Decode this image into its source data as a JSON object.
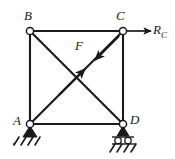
{
  "figure": {
    "type": "statics-truss-free-body-diagram",
    "stroke_color": "#1a1a1a",
    "fill_color": "#ffffff",
    "background": "#ffffff"
  },
  "labels": {
    "node_b": "B",
    "node_c": "C",
    "node_a": "A",
    "node_d": "D",
    "force_f": "F",
    "reaction_r": "R",
    "reaction_r_sub": "C"
  },
  "nodes": [
    {
      "id": "B",
      "label": "B",
      "x": 30,
      "y": 31
    },
    {
      "id": "C",
      "label": "C",
      "x": 123,
      "y": 31
    },
    {
      "id": "A",
      "label": "A",
      "x": 30,
      "y": 124
    },
    {
      "id": "D",
      "label": "D",
      "x": 123,
      "y": 124
    }
  ],
  "members": [
    {
      "from": "B",
      "to": "C",
      "kind": "chord"
    },
    {
      "from": "A",
      "to": "D",
      "kind": "chord"
    },
    {
      "from": "B",
      "to": "A",
      "kind": "post"
    },
    {
      "from": "C",
      "to": "D",
      "kind": "post"
    },
    {
      "from": "A",
      "to": "C",
      "kind": "diagonal"
    },
    {
      "from": "B",
      "to": "D",
      "kind": "diagonal"
    }
  ],
  "forces": [
    {
      "name": "F",
      "label": "F",
      "kind": "internal-tension-pair",
      "along": "A-C",
      "arrows": 2,
      "note": "two opposing arrowheads meeting near midpoint of diagonal A-C"
    },
    {
      "name": "R_C",
      "label": "R",
      "subscript": "C",
      "kind": "external-reaction",
      "at": "C",
      "direction": "right-horizontal"
    }
  ],
  "supports": [
    {
      "at": "A",
      "type": "pin",
      "hatching": true
    },
    {
      "at": "D",
      "type": "roller",
      "rollers": 2,
      "hatching": true
    }
  ]
}
